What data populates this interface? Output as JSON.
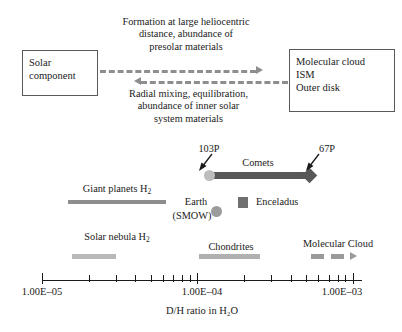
{
  "schematic": {
    "left_box": {
      "name": "solar-component-box",
      "lines": [
        "Solar",
        "component"
      ]
    },
    "right_box": {
      "name": "molecular-cloud-box",
      "lines": [
        "Molecular cloud",
        "ISM",
        "Outer disk"
      ]
    },
    "top_caption": {
      "lines": [
        "Formation at large heliocentric",
        "distance, abundance of",
        "presolar materials"
      ],
      "arrow_direction": "right"
    },
    "bottom_caption": {
      "lines": [
        "Radial mixing, equilibration,",
        "abundance of inner solar",
        "system materials"
      ],
      "arrow_direction": "left"
    },
    "arrow_color": "#8e8e8e",
    "box_border_color": "#5a5a5a"
  },
  "chart_data": {
    "type": "bar",
    "orientation": "horizontal-logarithmic-numberline",
    "title": "",
    "xlabel": "D/H ratio in H2O",
    "xlabel_rich": "D/H ratio in H₂O",
    "xscale": "log",
    "xlim": [
      1e-05,
      0.00115
    ],
    "grid": false,
    "legend": false,
    "tick_labels": [
      "1.00E–05",
      "1.00E–04",
      "1.00E–03"
    ],
    "tick_values": [
      1e-05,
      0.0001,
      0.001
    ],
    "minor_tick_values": [
      2e-05,
      3e-05,
      4e-05,
      5e-05,
      6e-05,
      7e-05,
      8e-05,
      9e-05,
      0.0002,
      0.0003,
      0.0004,
      0.0005,
      0.0006,
      0.0007,
      0.0008,
      0.0009
    ],
    "series": [
      {
        "name": "Giant planets H2",
        "label": "Giant planets H",
        "label_sub": "2",
        "type": "range",
        "x_start": 1.9e-05,
        "x_end": 5.2e-05,
        "color": "#8d8d8d"
      },
      {
        "name": "Solar nebula H2",
        "label": "Solar nebula H",
        "label_sub": "2",
        "type": "range",
        "x_start": 2e-05,
        "x_end": 2.9e-05,
        "color": "#b9b9b9"
      },
      {
        "name": "Comets",
        "label": "Comets",
        "type": "range",
        "x_start": 0.000155,
        "x_end": 0.00053,
        "color": "#585858"
      },
      {
        "name": "Chondrites",
        "label": "Chondrites",
        "type": "range",
        "x_start": 8.7e-05,
        "x_end": 0.00022,
        "color": "#b0b0b0"
      },
      {
        "name": "Molecular Cloud",
        "label": "Molecular Cloud",
        "type": "range-open",
        "x_start": 0.0007,
        "x_end": 0.0011,
        "color": "#9a9a9a"
      },
      {
        "name": "Earth (SMOW)",
        "label": "Earth",
        "label_line2": "(SMOW)",
        "type": "point-circle",
        "x": 0.000156,
        "color": "#9c9c9c"
      },
      {
        "name": "Enceladus",
        "label": "Enceladus",
        "type": "point-square",
        "x": 0.00029,
        "color": "#707070"
      }
    ],
    "annotations": [
      {
        "name": "103P",
        "text": "103P",
        "points_to_x": 0.000158,
        "marker": "circle",
        "marker_color": "#bdbdbd"
      },
      {
        "name": "67P",
        "text": "67P",
        "points_to_x": 0.00053,
        "marker": "diamond",
        "marker_color": "#585858"
      }
    ]
  }
}
